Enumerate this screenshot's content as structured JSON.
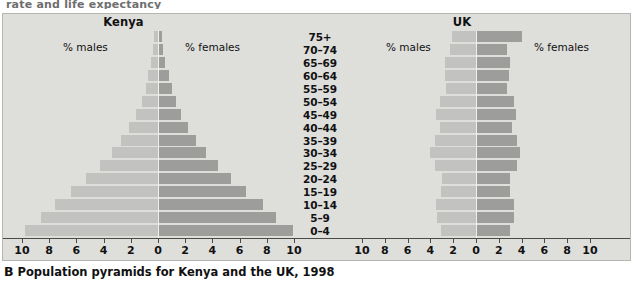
{
  "top_fragment": "rate and life expectancy",
  "caption": {
    "letter": "B",
    "text": "Population pyramids for Kenya and the UK, 1998"
  },
  "colors": {
    "male_bar": "#c2c2c0",
    "female_bar": "#9d9d9c",
    "panel_background": "#dededb",
    "frame_border": "#b6b5b1",
    "axis": "#4a4a48",
    "text": "#111111"
  },
  "annotations": {
    "males": "% males",
    "females": "% females"
  },
  "age_groups": [
    "75+",
    "70–74",
    "65–69",
    "60–64",
    "55–59",
    "50–54",
    "45–49",
    "40–44",
    "35–39",
    "30–34",
    "25–29",
    "20–24",
    "15–19",
    "10–14",
    "5–9",
    "0–4"
  ],
  "axis_ticks": [
    "10",
    "8",
    "6",
    "4",
    "2",
    "0",
    "2",
    "4",
    "6",
    "8",
    "10"
  ],
  "chart_data": [
    {
      "type": "bar",
      "subtype": "population-pyramid",
      "title": "Kenya",
      "xlabel": "% of population",
      "ylabel": "Age group",
      "xlim": [
        -10,
        10
      ],
      "axis_tick_values": [
        10,
        8,
        6,
        4,
        2,
        0,
        2,
        4,
        6,
        8,
        10
      ],
      "grid": false,
      "legend_position": "inside-top",
      "categories": [
        "75+",
        "70–74",
        "65–69",
        "60–64",
        "55–59",
        "50–54",
        "45–49",
        "40–44",
        "35–39",
        "30–34",
        "25–29",
        "20–24",
        "15–19",
        "10–14",
        "5–9",
        "0–4"
      ],
      "series": [
        {
          "name": "% males",
          "values": [
            0.3,
            0.35,
            0.5,
            0.7,
            0.9,
            1.2,
            1.6,
            2.1,
            2.7,
            3.4,
            4.3,
            5.3,
            6.4,
            7.6,
            8.6,
            9.8
          ]
        },
        {
          "name": "% females",
          "values": [
            0.3,
            0.4,
            0.55,
            0.8,
            1.0,
            1.3,
            1.7,
            2.2,
            2.8,
            3.5,
            4.4,
            5.4,
            6.5,
            7.7,
            8.7,
            9.9
          ]
        }
      ]
    },
    {
      "type": "bar",
      "subtype": "population-pyramid",
      "title": "UK",
      "xlabel": "% of population",
      "ylabel": "Age group",
      "xlim": [
        -10,
        10
      ],
      "axis_tick_values": [
        10,
        8,
        6,
        4,
        2,
        0,
        2,
        4,
        6,
        8,
        10
      ],
      "grid": false,
      "legend_position": "inside-top",
      "categories": [
        "75+",
        "70–74",
        "65–69",
        "60–64",
        "55–59",
        "50–54",
        "45–49",
        "40–44",
        "35–39",
        "30–34",
        "25–29",
        "20–24",
        "15–19",
        "10–14",
        "5–9",
        "0–4"
      ],
      "series": [
        {
          "name": "% males",
          "values": [
            2.1,
            2.3,
            2.7,
            2.7,
            2.6,
            3.2,
            3.5,
            3.2,
            3.6,
            4.0,
            3.6,
            3.0,
            3.1,
            3.5,
            3.4,
            3.1
          ]
        },
        {
          "name": "% females",
          "values": [
            4.0,
            2.7,
            3.0,
            2.9,
            2.7,
            3.3,
            3.5,
            3.2,
            3.6,
            3.9,
            3.6,
            3.0,
            3.0,
            3.3,
            3.3,
            3.0
          ]
        }
      ]
    }
  ]
}
